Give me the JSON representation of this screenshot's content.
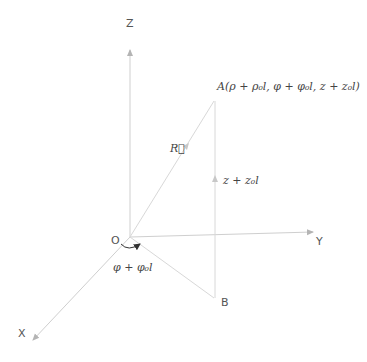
{
  "diagram": {
    "type": "cylindrical-coordinate-displacement",
    "colors": {
      "axis": "#c8c8c8",
      "line": "#d6d6d6",
      "arrowhead": "#b0b0b0",
      "text": "#444444",
      "curved_arrow": "#333333"
    },
    "axes": {
      "z": {
        "label": "Z"
      },
      "y": {
        "label": "Y"
      },
      "x": {
        "label": "X"
      }
    },
    "origin": {
      "label": "O"
    },
    "point_a": {
      "label": "A(ρ + ρ₀l, φ + φ₀l, z + z₀l)"
    },
    "point_b": {
      "label": "B"
    },
    "vector_r": {
      "label": "R⃗"
    },
    "vertical_component": {
      "label": "z + z₀l"
    },
    "angle": {
      "label": "φ + φ₀l"
    }
  }
}
